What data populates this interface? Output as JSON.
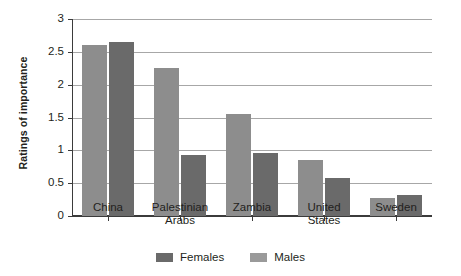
{
  "chart_data": {
    "type": "bar",
    "title": "",
    "subtitle": "",
    "xlabel": "",
    "ylabel": "Ratings of importance",
    "categories": [
      "China",
      "Palestinian Arabs",
      "Zambia",
      "United States",
      "Sweden"
    ],
    "category_lines": [
      [
        "China"
      ],
      [
        "Palestinian",
        "Arabs"
      ],
      [
        "Zambia"
      ],
      [
        "United",
        "States"
      ],
      [
        "Sweden"
      ]
    ],
    "series": [
      {
        "name": "Males",
        "color": "#8d8d8d",
        "values": [
          2.6,
          2.26,
          1.55,
          0.85,
          0.27
        ]
      },
      {
        "name": "Females",
        "color": "#6a6a6a",
        "values": [
          2.65,
          0.93,
          0.96,
          0.58,
          0.32
        ]
      }
    ],
    "ylim": [
      0,
      3
    ],
    "yticks": [
      0,
      0.5,
      1,
      1.5,
      2,
      2.5,
      3
    ],
    "ytick_labels": [
      "0",
      "0.5",
      "1",
      "1.5",
      "2",
      "2.5",
      "3"
    ],
    "grid": true,
    "grid_axis": "y",
    "grid_color": "#a7a7a7",
    "legend": {
      "position": "bottom",
      "entries": [
        {
          "label": "Females",
          "color": "#6a6a6a"
        },
        {
          "label": "Males",
          "color": "#9a9a9a"
        }
      ]
    },
    "axis_color": "#3b3b3b",
    "background": "#ffffff"
  }
}
